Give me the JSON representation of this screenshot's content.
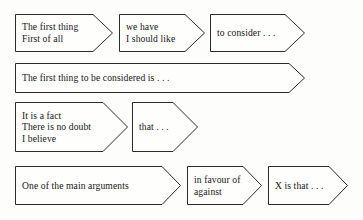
{
  "diagram": {
    "background_color": "#fdfdfc",
    "outline_color": "#2b2b2b",
    "text_color": "#171717",
    "rows": [
      {
        "id": "row-1",
        "boxes": [
          {
            "id": "row1-box1",
            "lines": [
              "The first thing",
              "First of all"
            ]
          },
          {
            "id": "row1-box2",
            "lines": [
              "we have",
              "I should like"
            ]
          },
          {
            "id": "row1-box3",
            "lines": [
              "to consider . . ."
            ]
          }
        ]
      },
      {
        "id": "row-2",
        "boxes": [
          {
            "id": "row2-box1",
            "lines": [
              "The first thing to be considered is . . ."
            ]
          }
        ]
      },
      {
        "id": "row-3",
        "boxes": [
          {
            "id": "row3-box1",
            "lines": [
              "It is a fact",
              "There is no doubt",
              "I believe"
            ]
          },
          {
            "id": "row3-box2",
            "lines": [
              "that . . ."
            ]
          }
        ]
      },
      {
        "id": "row-4",
        "boxes": [
          {
            "id": "row4-box1",
            "lines": [
              "One of the main arguments"
            ]
          },
          {
            "id": "row4-box2",
            "lines": [
              "in favour of",
              "against"
            ]
          },
          {
            "id": "row4-box3",
            "lines": [
              "X is that . . ."
            ]
          }
        ]
      }
    ]
  }
}
